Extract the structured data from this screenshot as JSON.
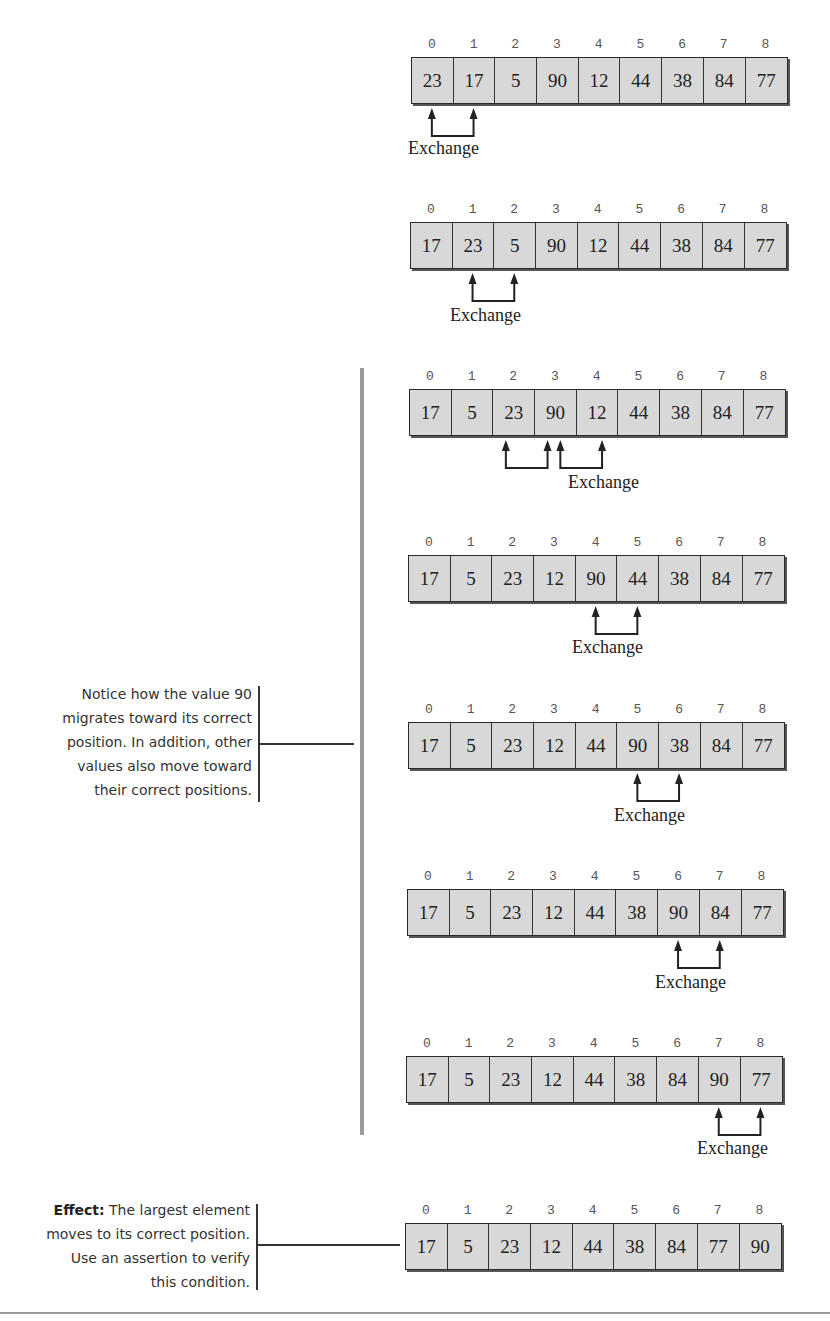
{
  "diagram": {
    "type": "bubble-sort-pass",
    "indices": [
      "0",
      "1",
      "2",
      "3",
      "4",
      "5",
      "6",
      "7",
      "8"
    ],
    "exchange_label": "Exchange",
    "steps": [
      {
        "values": [
          "23",
          "17",
          "5",
          "90",
          "12",
          "44",
          "38",
          "84",
          "77"
        ],
        "exchange": [
          0,
          1
        ]
      },
      {
        "values": [
          "17",
          "23",
          "5",
          "90",
          "12",
          "44",
          "38",
          "84",
          "77"
        ],
        "exchange": [
          1,
          2
        ]
      },
      {
        "values": [
          "17",
          "5",
          "23",
          "90",
          "12",
          "44",
          "38",
          "84",
          "77"
        ],
        "exchange": [
          2,
          3
        ],
        "also_shows_next_exchange": [
          3,
          4
        ]
      },
      {
        "values": [
          "17",
          "5",
          "23",
          "12",
          "90",
          "44",
          "38",
          "84",
          "77"
        ],
        "exchange": [
          4,
          5
        ]
      },
      {
        "values": [
          "17",
          "5",
          "23",
          "12",
          "44",
          "90",
          "38",
          "84",
          "77"
        ],
        "exchange": [
          5,
          6
        ]
      },
      {
        "values": [
          "17",
          "5",
          "23",
          "12",
          "44",
          "38",
          "90",
          "84",
          "77"
        ],
        "exchange": [
          6,
          7
        ]
      },
      {
        "values": [
          "17",
          "5",
          "23",
          "12",
          "44",
          "38",
          "84",
          "90",
          "77"
        ],
        "exchange": [
          7,
          8
        ]
      },
      {
        "values": [
          "17",
          "5",
          "23",
          "12",
          "44",
          "38",
          "84",
          "77",
          "90"
        ],
        "exchange": null
      }
    ]
  },
  "annotations": {
    "notice": {
      "lines": [
        "Notice how the value 90",
        "migrates toward its correct",
        "position. In addition, other",
        "values also move toward",
        "their correct positions."
      ]
    },
    "effect": {
      "label": "Effect:",
      "first_line_rest": " The largest element",
      "lines": [
        "moves to its correct position.",
        "Use an assertion to verify",
        "this condition."
      ]
    }
  },
  "colors": {
    "cell_fill": "#d8d8d8",
    "cell_border": "#2a2a2a",
    "divider_bar": "#9a9a9a",
    "text": "#222222"
  }
}
